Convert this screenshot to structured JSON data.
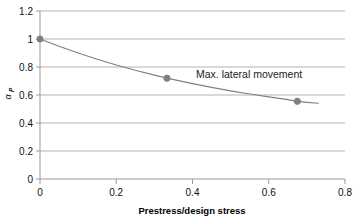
{
  "chart_data": {
    "type": "line",
    "title": "",
    "subtitle": "",
    "xlabel": "Prestress/design stress",
    "ylabel": "α",
    "ylabel_subscript": "P",
    "xlim": [
      0,
      0.8
    ],
    "ylim": [
      0,
      1.2
    ],
    "xticks": [
      "0",
      "0.2",
      "0.4",
      "0.6",
      "0.8"
    ],
    "xtick_values": [
      0,
      0.2,
      0.4,
      0.6,
      0.8
    ],
    "yticks": [
      "0",
      "0.2",
      "0.4",
      "0.6",
      "0.8",
      "1",
      "1.2"
    ],
    "ytick_values": [
      0,
      0.2,
      0.4,
      0.6,
      0.8,
      1.0,
      1.2
    ],
    "grid": "horizontal",
    "legend": "none",
    "series": [
      {
        "name": "Max. lateral movement",
        "marker": "circle",
        "color": "#808080",
        "x": [
          0,
          0.333,
          0.675
        ],
        "values": [
          1.0,
          0.72,
          0.555
        ]
      }
    ],
    "curve_points": [
      [
        0.0,
        1.0
      ],
      [
        0.05,
        0.948
      ],
      [
        0.1,
        0.9
      ],
      [
        0.15,
        0.855
      ],
      [
        0.2,
        0.814
      ],
      [
        0.25,
        0.777
      ],
      [
        0.3,
        0.742
      ],
      [
        0.333,
        0.72
      ],
      [
        0.4,
        0.681
      ],
      [
        0.45,
        0.655
      ],
      [
        0.5,
        0.63
      ],
      [
        0.55,
        0.607
      ],
      [
        0.6,
        0.587
      ],
      [
        0.65,
        0.567
      ],
      [
        0.675,
        0.555
      ],
      [
        0.7,
        0.548
      ],
      [
        0.73,
        0.541
      ]
    ],
    "annotations": [
      {
        "text": "Max. lateral movement",
        "x": 0.41,
        "y": 0.78
      }
    ],
    "colors": {
      "curve": "#808080",
      "marker": "#808080",
      "gridline": "#b3b3b3",
      "axis": "#808080",
      "text": "#111111",
      "background": "#ffffff"
    }
  }
}
